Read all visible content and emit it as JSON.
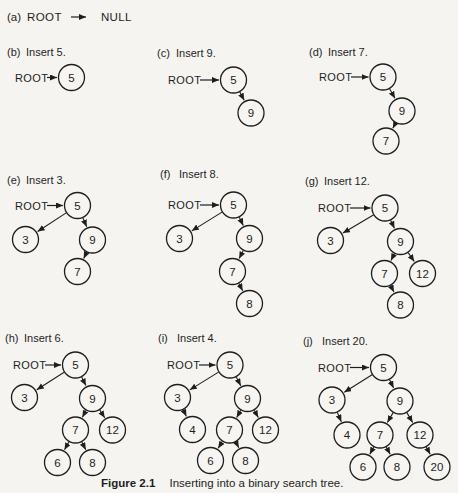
{
  "figure": {
    "background": "#f5f4f0",
    "paper": "#f6f5f1",
    "ink": "#1e1e1e",
    "node_radius": 13,
    "root_word": "ROOT",
    "caption": {
      "number": "Figure 2.1",
      "text": "Inserting into a binary search tree."
    },
    "panel_a": {
      "prefix": "(a)",
      "root": "ROOT",
      "arrow_icon": "right-arrow",
      "value": "NULL"
    },
    "panels": [
      {
        "id": "b",
        "prefix": "(b)",
        "title": "Insert 5.",
        "x": 0,
        "y": 40,
        "lx": 7,
        "labelY": 16,
        "rootX": 15,
        "rootTo": "5",
        "nodes": [
          {
            "v": "5",
            "x": 71.5,
            "y": 37.5
          }
        ],
        "edges": []
      },
      {
        "id": "c",
        "prefix": "(c)",
        "title": "Insert 9.",
        "x": 150,
        "y": 40,
        "lx": 7,
        "labelY": 17,
        "rootX": 18,
        "rootTo": "5",
        "nodes": [
          {
            "v": "5",
            "x": 83.5,
            "y": 40
          },
          {
            "v": "9",
            "x": 101,
            "y": 73
          }
        ],
        "edges": [
          [
            "5",
            "9"
          ]
        ]
      },
      {
        "id": "d",
        "prefix": "(d)",
        "title": "Insert 7.",
        "x": 300,
        "y": 40,
        "lx": 9,
        "labelY": 16,
        "rootX": 19,
        "rootTo": "5",
        "nodes": [
          {
            "v": "5",
            "x": 83,
            "y": 37
          },
          {
            "v": "9",
            "x": 102,
            "y": 71
          },
          {
            "v": "7",
            "x": 86,
            "y": 101
          }
        ],
        "edges": [
          [
            "5",
            "9"
          ],
          [
            "9",
            "7"
          ]
        ]
      },
      {
        "id": "e",
        "prefix": "(e)",
        "title": "Insert 3.",
        "x": 0,
        "y": 165,
        "lx": 7,
        "labelY": 19,
        "rootX": 15,
        "rootTo": "5",
        "nodes": [
          {
            "v": "5",
            "x": 77.5,
            "y": 40.5
          },
          {
            "v": "3",
            "x": 25.5,
            "y": 74.5
          },
          {
            "v": "9",
            "x": 92.5,
            "y": 75
          },
          {
            "v": "7",
            "x": 77.5,
            "y": 106.5
          }
        ],
        "edges": [
          [
            "5",
            "3"
          ],
          [
            "5",
            "9"
          ],
          [
            "9",
            "7"
          ]
        ]
      },
      {
        "id": "f",
        "prefix": "(f)",
        "title": "Insert 8.",
        "x": 150,
        "y": 165,
        "lx": 10,
        "labelY": 13,
        "rootX": 18,
        "rootTo": "5",
        "nodes": [
          {
            "v": "5",
            "x": 83.5,
            "y": 40
          },
          {
            "v": "3",
            "x": 29.5,
            "y": 73.5
          },
          {
            "v": "9",
            "x": 99.5,
            "y": 73.5
          },
          {
            "v": "7",
            "x": 82.5,
            "y": 106.5
          },
          {
            "v": "8",
            "x": 99.5,
            "y": 138.5
          }
        ],
        "edges": [
          [
            "5",
            "3"
          ],
          [
            "5",
            "9"
          ],
          [
            "9",
            "7"
          ],
          [
            "7",
            "8"
          ]
        ]
      },
      {
        "id": "g",
        "prefix": "(g)",
        "title": "Insert 12.",
        "x": 300,
        "y": 165,
        "lx": 5,
        "labelY": 20,
        "rootX": 18,
        "rootTo": "5",
        "nodes": [
          {
            "v": "5",
            "x": 85,
            "y": 43
          },
          {
            "v": "3",
            "x": 30.5,
            "y": 75.5
          },
          {
            "v": "9",
            "x": 100.5,
            "y": 76.5
          },
          {
            "v": "7",
            "x": 84.5,
            "y": 108.5
          },
          {
            "v": "12",
            "x": 122.5,
            "y": 108.5
          },
          {
            "v": "8",
            "x": 100.5,
            "y": 140
          }
        ],
        "edges": [
          [
            "5",
            "3"
          ],
          [
            "5",
            "9"
          ],
          [
            "9",
            "7"
          ],
          [
            "9",
            "12"
          ],
          [
            "7",
            "8"
          ]
        ]
      },
      {
        "id": "h",
        "prefix": "(h)",
        "title": "Insert 6.",
        "x": 0,
        "y": 330,
        "lx": 5,
        "labelY": 12,
        "rootX": 13,
        "rootTo": "5",
        "nodes": [
          {
            "v": "5",
            "x": 75.5,
            "y": 35
          },
          {
            "v": "3",
            "x": 24.5,
            "y": 67.5
          },
          {
            "v": "9",
            "x": 92.5,
            "y": 68.5
          },
          {
            "v": "7",
            "x": 75.5,
            "y": 100
          },
          {
            "v": "12",
            "x": 112.5,
            "y": 100
          },
          {
            "v": "6",
            "x": 57.5,
            "y": 132.5
          },
          {
            "v": "8",
            "x": 92.5,
            "y": 132.5
          }
        ],
        "edges": [
          [
            "5",
            "3"
          ],
          [
            "5",
            "9"
          ],
          [
            "9",
            "7"
          ],
          [
            "9",
            "12"
          ],
          [
            "7",
            "6"
          ],
          [
            "7",
            "8"
          ]
        ]
      },
      {
        "id": "i",
        "prefix": "(i)",
        "title": "Insert 4.",
        "x": 150,
        "y": 330,
        "lx": 8,
        "labelY": 12,
        "rootX": 17,
        "rootTo": "5",
        "nodes": [
          {
            "v": "5",
            "x": 80,
            "y": 35
          },
          {
            "v": "3",
            "x": 27.5,
            "y": 67.5
          },
          {
            "v": "9",
            "x": 97.5,
            "y": 68.5
          },
          {
            "v": "4",
            "x": 42.5,
            "y": 99.5
          },
          {
            "v": "7",
            "x": 79.5,
            "y": 100
          },
          {
            "v": "12",
            "x": 115.5,
            "y": 100
          },
          {
            "v": "6",
            "x": 60.5,
            "y": 130.5
          },
          {
            "v": "8",
            "x": 95.5,
            "y": 130.5
          }
        ],
        "edges": [
          [
            "5",
            "3"
          ],
          [
            "3",
            "4"
          ],
          [
            "5",
            "9"
          ],
          [
            "9",
            "7"
          ],
          [
            "9",
            "12"
          ],
          [
            "7",
            "6"
          ],
          [
            "7",
            "8"
          ]
        ]
      },
      {
        "id": "j",
        "prefix": "(j)",
        "title": "Insert 20.",
        "x": 300,
        "y": 330,
        "lx": 3,
        "labelY": 15,
        "rootX": 18,
        "rootTo": "5",
        "nodes": [
          {
            "v": "5",
            "x": 83.5,
            "y": 37.5
          },
          {
            "v": "3",
            "x": 32,
            "y": 70
          },
          {
            "v": "9",
            "x": 100,
            "y": 71
          },
          {
            "v": "4",
            "x": 47,
            "y": 105
          },
          {
            "v": "7",
            "x": 80,
            "y": 105
          },
          {
            "v": "12",
            "x": 120,
            "y": 105
          },
          {
            "v": "6",
            "x": 63,
            "y": 137
          },
          {
            "v": "8",
            "x": 97,
            "y": 137
          },
          {
            "v": "20",
            "x": 137,
            "y": 137
          }
        ],
        "edges": [
          [
            "5",
            "3"
          ],
          [
            "3",
            "4"
          ],
          [
            "5",
            "9"
          ],
          [
            "9",
            "7"
          ],
          [
            "9",
            "12"
          ],
          [
            "12",
            "20"
          ],
          [
            "7",
            "6"
          ],
          [
            "7",
            "8"
          ]
        ]
      }
    ]
  }
}
